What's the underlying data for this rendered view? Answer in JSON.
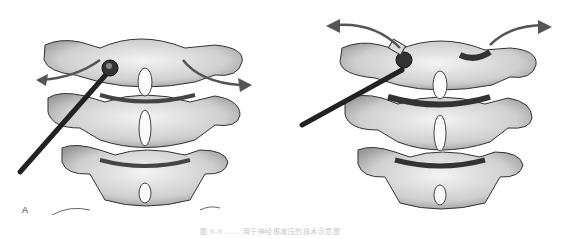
{
  "figure": {
    "panels": [
      {
        "label": "A",
        "description": "Probe inserted into left facet joint of cervical spine, curved arrows indicating lateral motion"
      },
      {
        "label": "B",
        "description": "Probe levering the facet joint with arrows showing opening motion upward-outward"
      }
    ],
    "caption": "图 X-X  ……  用于神经根减压的技术示意图"
  },
  "colors": {
    "bone": "#e6e6e6",
    "shadow": "#6f6f6f",
    "outline": "#333333",
    "probe": "#2a2a2a",
    "arrow": "#555555"
  }
}
